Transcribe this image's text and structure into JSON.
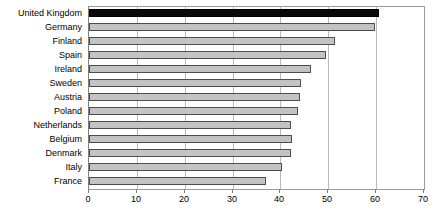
{
  "chart_data": {
    "type": "bar",
    "orientation": "horizontal",
    "title": "",
    "subtitle": "",
    "xlabel": "",
    "ylabel": "",
    "xlim": [
      0,
      70
    ],
    "xticks": [
      0,
      10,
      20,
      30,
      40,
      50,
      60,
      70
    ],
    "grid": true,
    "legend": false,
    "legend_position": "none",
    "highlight_category": "United Kingdom",
    "highlight_color": "#0a0a0a",
    "bar_color": "#c3c3c3",
    "bar_border_color": "#4d4d4d",
    "categories": [
      "United Kingdom",
      "Germany",
      "Finland",
      "Spain",
      "Ireland",
      "Sweden",
      "Austria",
      "Poland",
      "Netherlands",
      "Belgium",
      "Denmark",
      "Italy",
      "France"
    ],
    "values": [
      60.6,
      59.8,
      51.4,
      49.5,
      46.4,
      44.3,
      44.1,
      43.7,
      42.2,
      42.4,
      42.2,
      40.3,
      37.0
    ]
  }
}
